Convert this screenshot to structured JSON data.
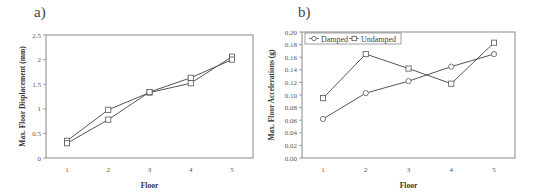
{
  "chart_data": [
    {
      "type": "line",
      "panel_label": "a)",
      "title": "",
      "xlabel": "Floor",
      "ylabel": "Max. Floor Displacement (mm)",
      "categories": [
        "1",
        "2",
        "3",
        "4",
        "5"
      ],
      "x": [
        1,
        2,
        3,
        4,
        5
      ],
      "ylim": [
        0,
        2.5
      ],
      "yticks": [
        "0",
        "0.5",
        "1",
        "1.5",
        "2",
        "2.5"
      ],
      "ytick_values": [
        0,
        0.5,
        1,
        1.5,
        2,
        2.5
      ],
      "grid": false,
      "legend": null,
      "series": [
        {
          "name": "Series A",
          "marker": "square",
          "values": [
            0.35,
            0.98,
            1.33,
            1.52,
            2.06
          ]
        },
        {
          "name": "Series B",
          "marker": "square",
          "values": [
            0.3,
            0.78,
            1.34,
            1.63,
            2.0
          ]
        }
      ]
    },
    {
      "type": "line",
      "panel_label": "b)",
      "title": "",
      "xlabel": "Floor",
      "ylabel": "Max. Floor Accelerations (g)",
      "categories": [
        "1",
        "2",
        "3",
        "4",
        "5"
      ],
      "x": [
        1,
        2,
        3,
        4,
        5
      ],
      "ylim": [
        0,
        0.2
      ],
      "yticks": [
        "0.00",
        "0.02",
        "0.04",
        "0.06",
        "0.08",
        "0.10",
        "0.12",
        "0.14",
        "0.16",
        "0.18",
        "0.20"
      ],
      "ytick_values": [
        0,
        0.02,
        0.04,
        0.06,
        0.08,
        0.1,
        0.12,
        0.14,
        0.16,
        0.18,
        0.2
      ],
      "grid": false,
      "legend": {
        "position": "top-left",
        "entries": [
          "Damped",
          "Undamped"
        ]
      },
      "series": [
        {
          "name": "Damped",
          "marker": "circle",
          "values": [
            0.062,
            0.103,
            0.122,
            0.145,
            0.165
          ]
        },
        {
          "name": "Undamped",
          "marker": "square",
          "values": [
            0.095,
            0.165,
            0.142,
            0.118,
            0.183
          ]
        }
      ]
    }
  ],
  "panels": {
    "a": {
      "label": "a)"
    },
    "b": {
      "label": "b)"
    }
  },
  "style": {
    "line_color": "#555555",
    "frame_color": "#888888",
    "marker_fill": "#ffffff"
  }
}
